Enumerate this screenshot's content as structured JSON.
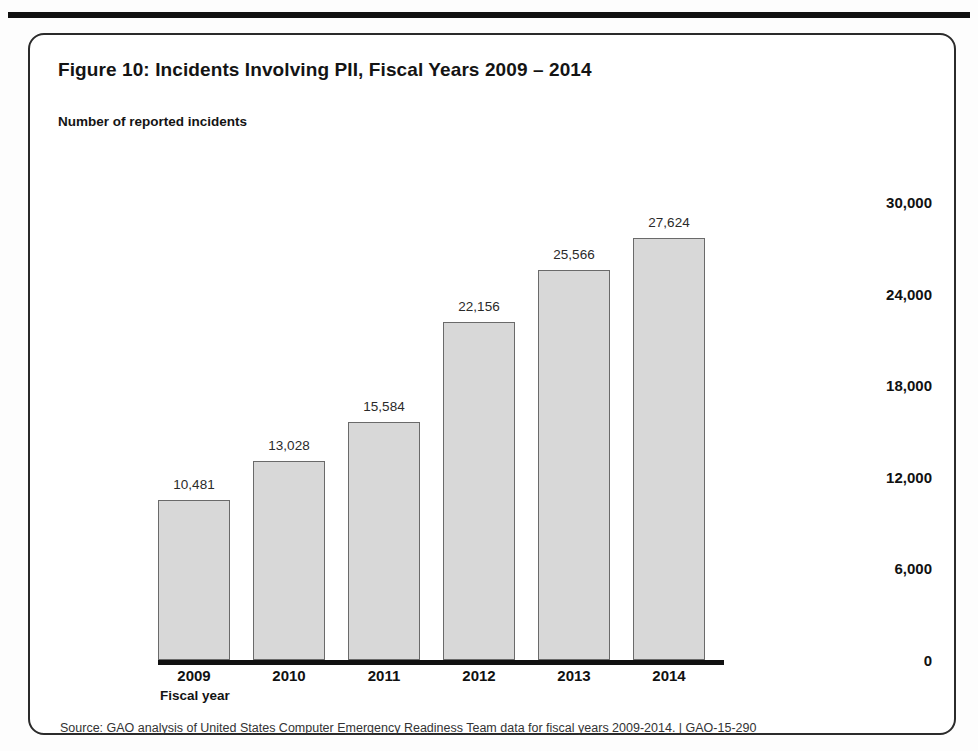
{
  "page": {
    "top_rule": "horizontal-rule"
  },
  "figure": {
    "title": "Figure 10: Incidents Involving PII, Fiscal Years 2009 – 2014",
    "y_axis_title": "Number of reported incidents",
    "x_axis_title": "Fiscal year",
    "source_note": "Source: GAO analysis of United States Computer Emergency Readiness Team data for fiscal years 2009-2014.  |  GAO-15-290"
  },
  "colors": {
    "bar_fill": "#d8d8d8",
    "bar_stroke": "#6a6a6a",
    "axis": "#111111",
    "text": "#141414",
    "frame": "#2b2b2b"
  },
  "chart_data": {
    "type": "bar",
    "title": "Figure 10: Incidents Involving PII, Fiscal Years 2009 – 2014",
    "xlabel": "Fiscal year",
    "ylabel": "Number of reported incidents",
    "categories": [
      "2009",
      "2010",
      "2011",
      "2012",
      "2013",
      "2014"
    ],
    "values": [
      10481,
      13028,
      15584,
      22156,
      25566,
      27624
    ],
    "value_labels": [
      "10,481",
      "13,028",
      "15,584",
      "22,156",
      "25,566",
      "27,624"
    ],
    "ylim": [
      0,
      30000
    ],
    "ytick_values": [
      0,
      6000,
      12000,
      18000,
      24000,
      30000
    ],
    "ytick_labels": [
      "0",
      "6,000",
      "12,000",
      "18,000",
      "24,000",
      "30,000"
    ],
    "grid": false,
    "legend": null
  }
}
